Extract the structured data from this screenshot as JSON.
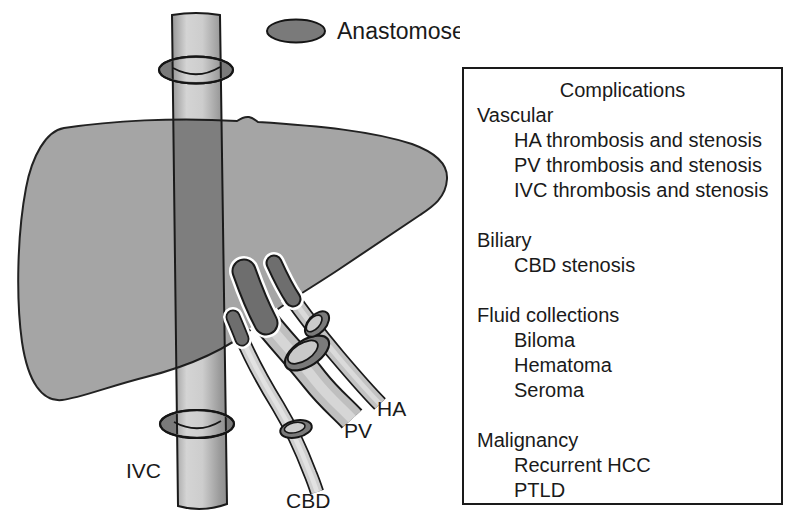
{
  "legend": {
    "label": "Anastomoses"
  },
  "diagram": {
    "vessel_labels": {
      "ivc": "IVC",
      "cbd": "CBD",
      "pv": "PV",
      "ha": "HA"
    }
  },
  "complications_box": {
    "title": "Complications",
    "sections": [
      {
        "heading": "Vascular",
        "items": [
          "HA thrombosis and stenosis",
          "PV thrombosis and stenosis",
          "IVC thrombosis and stenosis"
        ]
      },
      {
        "heading": "Biliary",
        "items": [
          "CBD stenosis"
        ]
      },
      {
        "heading": "Fluid collections",
        "items": [
          "Biloma",
          "Hematoma",
          "Seroma"
        ]
      },
      {
        "heading": "Malignancy",
        "items": [
          "Recurrent HCC",
          "PTLD"
        ]
      }
    ]
  },
  "colors": {
    "background": "#ffffff",
    "liver": "#a5a5a5",
    "anastomosis_ring": "#7a7a7a",
    "vessel_light": "#c6c6c6",
    "vessel_intrahepatic_dark": "#6e6e6e",
    "outline": "#1a1a1a"
  }
}
